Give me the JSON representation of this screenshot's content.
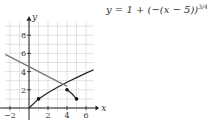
{
  "equation": {
    "prefix": "y = 1 + (−(x − 5))",
    "exponent": "3/4"
  },
  "chart_data": {
    "type": "line",
    "title": "",
    "xlabel": "x",
    "ylabel": "y",
    "xlim": [
      -2.5,
      7
    ],
    "ylim": [
      -0.5,
      9.5
    ],
    "grid": true,
    "x_ticks": [
      -2,
      2,
      4,
      6
    ],
    "y_ticks": [
      2,
      4,
      6,
      8
    ],
    "series": [
      {
        "name": "y = sqrt-type increasing curve",
        "color": "#222222",
        "points": [
          [
            0,
            0
          ],
          [
            1,
            1
          ],
          [
            2,
            1.68
          ],
          [
            3,
            2.28
          ],
          [
            4,
            2.83
          ],
          [
            5,
            3.34
          ],
          [
            6,
            3.83
          ],
          [
            6.8,
            4.2
          ]
        ]
      },
      {
        "name": "y = 1 + (−(x − 5))^{3/4}",
        "color": "#222222",
        "points": [
          [
            4,
            2
          ],
          [
            4.5,
            1.59
          ],
          [
            5,
            1
          ]
        ],
        "markers": [
          [
            4,
            2
          ],
          [
            5,
            1
          ]
        ]
      },
      {
        "name": "decreasing line",
        "color": "#777777",
        "points": [
          [
            -2.5,
            5.9
          ],
          [
            3.5,
            2.65
          ],
          [
            4,
            2.4
          ]
        ]
      }
    ],
    "markers": [
      [
        1,
        1
      ],
      [
        4,
        2
      ],
      [
        5,
        1
      ]
    ]
  }
}
